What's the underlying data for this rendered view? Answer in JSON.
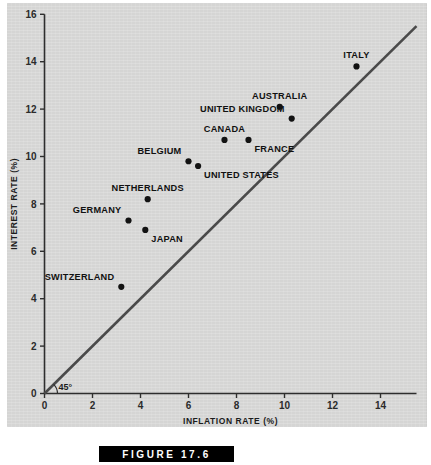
{
  "figure": {
    "caption": "FIGURE 17.6"
  },
  "chart_data": {
    "type": "scatter",
    "title": "",
    "xlabel": "INFLATION RATE (%)",
    "ylabel": "INTEREST RATE (%)",
    "xlim": [
      0,
      15.5
    ],
    "ylim": [
      0,
      16
    ],
    "xticks": [
      0,
      2,
      4,
      6,
      8,
      10,
      12,
      14
    ],
    "xticklabels": [
      "0",
      "2",
      "4",
      "6",
      "8",
      "10",
      "12",
      "14"
    ],
    "yticks": [
      0,
      2,
      4,
      6,
      8,
      10,
      12,
      14,
      16
    ],
    "yticklabels": [
      "0",
      "2",
      "4",
      "6",
      "8",
      "10",
      "12",
      "14",
      "16"
    ],
    "grid": false,
    "legend": "none",
    "points": [
      {
        "label": "SWITZERLAND",
        "x": 3.2,
        "y": 4.5,
        "label_pos": "upper-left"
      },
      {
        "label": "JAPAN",
        "x": 4.2,
        "y": 6.9,
        "label_pos": "lower-right"
      },
      {
        "label": "GERMANY",
        "x": 3.5,
        "y": 7.3,
        "label_pos": "upper-left"
      },
      {
        "label": "NETHERLANDS",
        "x": 4.3,
        "y": 8.2,
        "label_pos": "upper"
      },
      {
        "label": "UNITED STATES",
        "x": 6.4,
        "y": 9.6,
        "label_pos": "lower-right"
      },
      {
        "label": "BELGIUM",
        "x": 6.0,
        "y": 9.8,
        "label_pos": "upper-left"
      },
      {
        "label": "CANADA",
        "x": 7.5,
        "y": 10.7,
        "label_pos": "upper"
      },
      {
        "label": "FRANCE",
        "x": 8.5,
        "y": 10.7,
        "label_pos": "lower-right"
      },
      {
        "label": "UNITED KINGDOM",
        "x": 10.3,
        "y": 11.6,
        "label_pos": "upper-left"
      },
      {
        "label": "AUSTRALIA",
        "x": 9.8,
        "y": 12.1,
        "label_pos": "upper"
      },
      {
        "label": "ITALY",
        "x": 13.0,
        "y": 13.8,
        "label_pos": "upper"
      }
    ],
    "reference_line": {
      "name": "45-degree-line",
      "annotation": "45°",
      "from": [
        0,
        0
      ],
      "to": [
        15.5,
        15.5
      ],
      "color": "#4a4a4a"
    },
    "colors": {
      "background": "#d5d5d4",
      "axis": "#2e2e2e",
      "marker": "#121212",
      "reference_line": "#4a4a4a"
    }
  }
}
